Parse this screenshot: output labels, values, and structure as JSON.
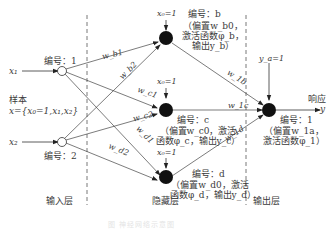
{
  "diagram": {
    "type": "neural-network",
    "layers": {
      "input": "输入层",
      "hidden": "隐藏层",
      "output": "输出层"
    },
    "sample_label": "样本",
    "sample_formula": "x={x₀=1,x₁,x₂}",
    "inputs": [
      {
        "name": "x₁",
        "id_label": "编号：1"
      },
      {
        "name": "x₂",
        "id_label": "编号：2"
      }
    ],
    "hidden_nodes": [
      {
        "id_label": "编号：b",
        "bias_input": "x₀=1",
        "desc_lines": [
          "（偏置w_b0，",
          "激活函数φ_b，",
          "输出y_b）"
        ]
      },
      {
        "id_label": "编号：c",
        "bias_input": "x₀=1",
        "desc_lines": [
          "（偏置w_c0，激活",
          "函数φ_c，输出y_c）"
        ]
      },
      {
        "id_label": "编号：d",
        "bias_input": "x₀=1",
        "desc_lines": [
          "（偏置w_d0，激活",
          "函数φ_d，输出y_d）"
        ]
      }
    ],
    "output_node": {
      "id_label": "编号：1",
      "bias_input": "y_a=1",
      "desc_lines": [
        "（偏置w_1a，",
        "激活函数φ_1）"
      ]
    },
    "response_label": "响应",
    "response_var": "y",
    "weights": {
      "wb1": "w_b1",
      "wb2": "w_b2",
      "wc1": "w_c1",
      "wc2": "w_c2",
      "wd1": "w_d1",
      "wd2": "w_d2",
      "w1b": "w_1b",
      "w1c": "w_1c",
      "w1d": "w_1d"
    },
    "caption": "图  神经网络示意图"
  }
}
